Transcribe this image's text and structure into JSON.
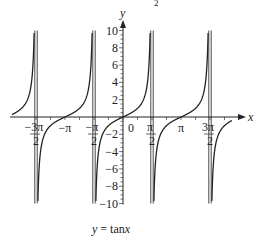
{
  "chart_data": {
    "type": "line",
    "title": "",
    "caption": "y = tanx",
    "xlabel": "x",
    "ylabel": "y",
    "function": "tan(x)",
    "xlim": [
      -4.9,
      5.4
    ],
    "ylim": [
      -10,
      10
    ],
    "x_ticks": [
      {
        "value": -4.712,
        "label_num": "−3π",
        "label_den": "2"
      },
      {
        "value": -3.1416,
        "label": "−π"
      },
      {
        "value": -1.5708,
        "label_num": "−π",
        "label_den": "2"
      },
      {
        "value": 0,
        "label": "0"
      },
      {
        "value": 1.5708,
        "label_num": "π",
        "label_den": "2"
      },
      {
        "value": 3.1416,
        "label": "π"
      },
      {
        "value": 4.712,
        "label_num": "3π",
        "label_den": "2"
      }
    ],
    "y_ticks": [
      10,
      8,
      6,
      4,
      2,
      -2,
      -4,
      -6,
      -8,
      -10
    ],
    "y_tick_labels": [
      "10",
      "8",
      "6",
      "4",
      "2",
      "−2",
      "−4",
      "−6",
      "−8",
      "−10"
    ],
    "asymptotes": [
      -4.712,
      -1.5708,
      1.5708,
      4.712
    ],
    "series": [
      {
        "name": "y = tan x",
        "branches": [
          {
            "x_range": [
              -6.28,
              -4.712
            ]
          },
          {
            "x_range": [
              -4.712,
              -1.5708
            ]
          },
          {
            "x_range": [
              -1.5708,
              1.5708
            ]
          },
          {
            "x_range": [
              1.5708,
              4.712
            ]
          },
          {
            "x_range": [
              4.712,
              5.5
            ]
          }
        ]
      }
    ],
    "grid": false,
    "sample_points": [
      {
        "x": -3.1416,
        "y": 0
      },
      {
        "x": 0,
        "y": 0
      },
      {
        "x": 3.1416,
        "y": 0
      },
      {
        "x": 0.785,
        "y": 1
      },
      {
        "x": -0.785,
        "y": -1
      }
    ]
  },
  "labels": {
    "x_axis": "x",
    "y_axis": "y",
    "caption_lhs": "y",
    "caption_rhs": " = tan",
    "caption_var": "x",
    "top_fragment": "2"
  }
}
